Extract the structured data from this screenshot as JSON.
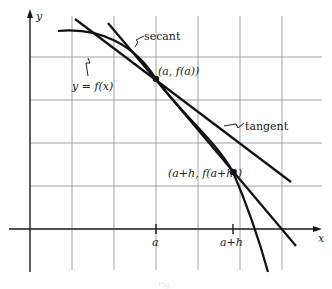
{
  "diagram": {
    "type": "calculus secant and tangent illustration",
    "axes": {
      "x_label": "x",
      "y_label": "y"
    },
    "curve_label": "y = f(x)",
    "lines": {
      "secant_label": "secant",
      "tangent_label": "tangent"
    },
    "points": [
      {
        "label": "(a, f(a))"
      },
      {
        "label": "(a+h, f(a+h))"
      }
    ],
    "x_ticks": [
      {
        "label": "a"
      },
      {
        "label": "a+h"
      }
    ],
    "caption": "Fig."
  },
  "colors": {
    "background": "#ffffff",
    "ink": "#111111",
    "grid": "#8a8a8a"
  }
}
